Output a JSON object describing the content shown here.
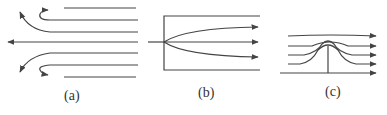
{
  "panels": [
    {
      "id": "a",
      "label": "(a)",
      "description": "Flow reversal: horizontal streamlines flowing left, outer lines curve back (U-turn) with arrows"
    },
    {
      "id": "b",
      "label": "(b)",
      "description": "Flow entering a channel: single incoming line splits into three diverging arrows inside a box"
    },
    {
      "id": "c",
      "label": "(c)",
      "description": "Flow over an obstacle: streamlines deflect over a bump with vertical post, arrows pointing right"
    }
  ],
  "colors": {
    "stroke": "#444444",
    "background": "#ffffff"
  }
}
